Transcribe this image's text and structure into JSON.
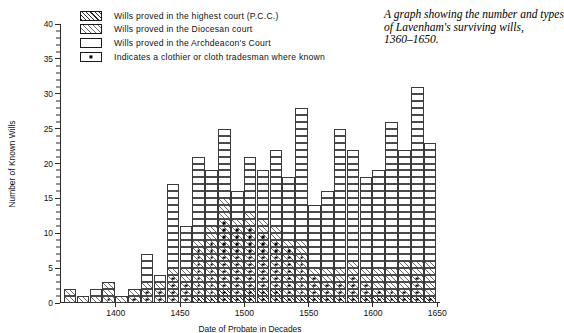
{
  "title": {
    "lines": [
      "A graph showing the number and types",
      "of Lavenham's surviving wills,",
      "1360–1650."
    ]
  },
  "legend": {
    "items": [
      {
        "swatch": "pcc-hatch-swatch",
        "label": "Wills proved in the highest court (P.C.C.)"
      },
      {
        "swatch": "diocesan-hatch-swatch",
        "label": "Wills proved in the Diocesan court"
      },
      {
        "swatch": "archdeacon-white-swatch",
        "label": "Wills proved in the Archdeacon's Court"
      },
      {
        "swatch": "clothier-dot-swatch",
        "label": "Indicates a clothier or cloth tradesman where known"
      }
    ]
  },
  "chart_data": {
    "type": "bar",
    "title": "A graph showing the number and types of Lavenham's surviving wills, 1360–1650.",
    "subtitle": "",
    "xlabel": "Date of Probate in Decades",
    "ylabel": "Number of Known Wills",
    "xlim": [
      1360,
      1650
    ],
    "ylim": [
      0,
      40
    ],
    "ytick_step": 5,
    "yticks": [
      0,
      5,
      10,
      15,
      20,
      25,
      30,
      35,
      40
    ],
    "xticks": [
      1400,
      1450,
      1500,
      1550,
      1600,
      1650
    ],
    "grid": false,
    "legend_position": "top-left",
    "bin_width_years": 10,
    "stacking": "stacked",
    "series": [
      {
        "name": "Wills proved in the highest court (P.C.C.)",
        "fill": "pcc-hatch"
      },
      {
        "name": "Wills proved in the Diocesan court",
        "fill": "diocesan-hatch"
      },
      {
        "name": "Wills proved in the Archdeacon's Court",
        "fill": "archdeacon-white"
      }
    ],
    "marker_note": "Indicates a clothier or cloth tradesman where known",
    "categories": [
      "1360",
      "1370",
      "1380",
      "1390",
      "1400",
      "1410",
      "1420",
      "1430",
      "1440",
      "1450",
      "1460",
      "1470",
      "1480",
      "1490",
      "1500",
      "1510",
      "1520",
      "1530",
      "1540",
      "1550",
      "1560",
      "1570",
      "1580",
      "1590",
      "1600",
      "1610",
      "1620",
      "1630",
      "1640"
    ],
    "bars": [
      {
        "decade": "1360",
        "total": 2,
        "pcc": 0,
        "diocesan": 2,
        "archdeacon": 0,
        "clothiers": 0
      },
      {
        "decade": "1370",
        "total": 1,
        "pcc": 0,
        "diocesan": 1,
        "archdeacon": 0,
        "clothiers": 0
      },
      {
        "decade": "1380",
        "total": 2,
        "pcc": 0,
        "diocesan": 1,
        "archdeacon": 1,
        "clothiers": 0
      },
      {
        "decade": "1390",
        "total": 3,
        "pcc": 0,
        "diocesan": 3,
        "archdeacon": 0,
        "clothiers": 1
      },
      {
        "decade": "1400",
        "total": 1,
        "pcc": 0,
        "diocesan": 1,
        "archdeacon": 0,
        "clothiers": 0
      },
      {
        "decade": "1410",
        "total": 2,
        "pcc": 0,
        "diocesan": 2,
        "archdeacon": 0,
        "clothiers": 1
      },
      {
        "decade": "1420",
        "total": 7,
        "pcc": 0,
        "diocesan": 3,
        "archdeacon": 4,
        "clothiers": 2
      },
      {
        "decade": "1430",
        "total": 4,
        "pcc": 0,
        "diocesan": 3,
        "archdeacon": 1,
        "clothiers": 2
      },
      {
        "decade": "1440",
        "total": 17,
        "pcc": 0,
        "diocesan": 5,
        "archdeacon": 12,
        "clothiers": 4
      },
      {
        "decade": "1450",
        "total": 11,
        "pcc": 0,
        "diocesan": 5,
        "archdeacon": 6,
        "clothiers": 3
      },
      {
        "decade": "1460",
        "total": 21,
        "pcc": 1,
        "diocesan": 8,
        "archdeacon": 12,
        "clothiers": 8
      },
      {
        "decade": "1470",
        "total": 19,
        "pcc": 1,
        "diocesan": 10,
        "archdeacon": 8,
        "clothiers": 9
      },
      {
        "decade": "1480",
        "total": 25,
        "pcc": 2,
        "diocesan": 13,
        "archdeacon": 10,
        "clothiers": 12
      },
      {
        "decade": "1490",
        "total": 16,
        "pcc": 1,
        "diocesan": 11,
        "archdeacon": 4,
        "clothiers": 11
      },
      {
        "decade": "1500",
        "total": 21,
        "pcc": 2,
        "diocesan": 11,
        "archdeacon": 8,
        "clothiers": 11
      },
      {
        "decade": "1510",
        "total": 19,
        "pcc": 2,
        "diocesan": 10,
        "archdeacon": 7,
        "clothiers": 10
      },
      {
        "decade": "1520",
        "total": 22,
        "pcc": 2,
        "diocesan": 9,
        "archdeacon": 11,
        "clothiers": 9
      },
      {
        "decade": "1530",
        "total": 18,
        "pcc": 1,
        "diocesan": 8,
        "archdeacon": 9,
        "clothiers": 8
      },
      {
        "decade": "1540",
        "total": 28,
        "pcc": 1,
        "diocesan": 8,
        "archdeacon": 19,
        "clothiers": 7
      },
      {
        "decade": "1550",
        "total": 14,
        "pcc": 1,
        "diocesan": 4,
        "archdeacon": 9,
        "clothiers": 4
      },
      {
        "decade": "1560",
        "total": 16,
        "pcc": 1,
        "diocesan": 4,
        "archdeacon": 11,
        "clothiers": 3
      },
      {
        "decade": "1570",
        "total": 25,
        "pcc": 1,
        "diocesan": 4,
        "archdeacon": 20,
        "clothiers": 3
      },
      {
        "decade": "1580",
        "total": 22,
        "pcc": 1,
        "diocesan": 5,
        "archdeacon": 16,
        "clothiers": 4
      },
      {
        "decade": "1590",
        "total": 18,
        "pcc": 1,
        "diocesan": 4,
        "archdeacon": 13,
        "clothiers": 3
      },
      {
        "decade": "1600",
        "total": 19,
        "pcc": 1,
        "diocesan": 4,
        "archdeacon": 14,
        "clothiers": 2
      },
      {
        "decade": "1610",
        "total": 26,
        "pcc": 1,
        "diocesan": 4,
        "archdeacon": 21,
        "clothiers": 2
      },
      {
        "decade": "1620",
        "total": 22,
        "pcc": 1,
        "diocesan": 5,
        "archdeacon": 16,
        "clothiers": 2
      },
      {
        "decade": "1630",
        "total": 31,
        "pcc": 1,
        "diocesan": 5,
        "archdeacon": 25,
        "clothiers": 4
      },
      {
        "decade": "1640",
        "total": 23,
        "pcc": 1,
        "diocesan": 5,
        "archdeacon": 17,
        "clothiers": 1
      }
    ]
  }
}
